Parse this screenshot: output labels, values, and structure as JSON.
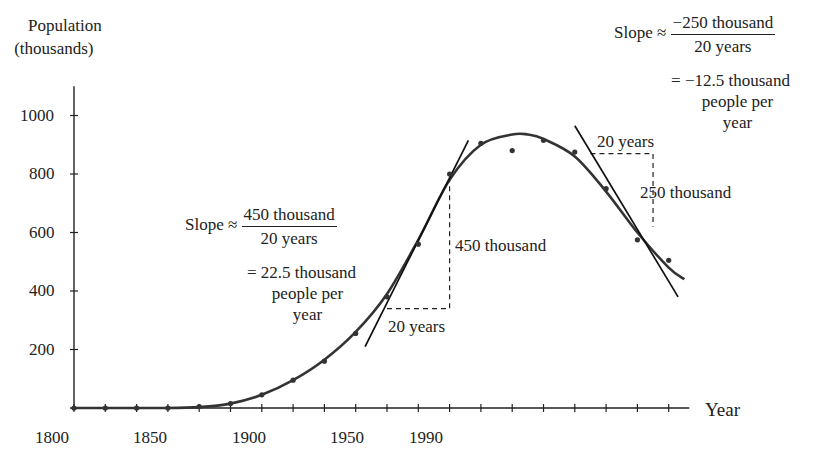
{
  "chart_data": {
    "type": "scatter",
    "title": "",
    "ylabel": "Population (thousands)",
    "ylabel_lines": [
      "Population",
      "(thousands)"
    ],
    "xlabel": "Year",
    "xlim": [
      1800,
      1995
    ],
    "ylim": [
      0,
      1100
    ],
    "x_tick_labels": [
      "1800",
      "1850",
      "1900",
      "1950",
      "1990"
    ],
    "x_tick_values": [
      1800,
      1850,
      1900,
      1950,
      1990
    ],
    "x_minor_ticks_every": 10,
    "y_tick_labels": [
      "200",
      "400",
      "600",
      "800",
      "1000"
    ],
    "y_tick_values": [
      200,
      400,
      600,
      800,
      1000
    ],
    "grid": false,
    "legend": null,
    "series": [
      {
        "name": "Population data points",
        "type": "scatter",
        "x": [
          1800,
          1810,
          1820,
          1830,
          1840,
          1850,
          1860,
          1870,
          1880,
          1890,
          1900,
          1910,
          1920,
          1930,
          1940,
          1950,
          1960,
          1970,
          1980,
          1990
        ],
        "values": [
          0,
          0,
          0,
          0,
          5,
          15,
          45,
          95,
          160,
          255,
          380,
          560,
          800,
          905,
          880,
          915,
          875,
          750,
          575,
          505
        ]
      },
      {
        "name": "Fitted curve",
        "type": "line",
        "x": [
          1800,
          1830,
          1840,
          1850,
          1860,
          1870,
          1880,
          1890,
          1900,
          1910,
          1920,
          1930,
          1940,
          1945,
          1950,
          1960,
          1970,
          1980,
          1990,
          1995
        ],
        "values": [
          0,
          0,
          3,
          15,
          45,
          95,
          165,
          260,
          390,
          575,
          780,
          900,
          935,
          935,
          920,
          860,
          740,
          600,
          480,
          440
        ]
      },
      {
        "name": "Tangent line near 1920",
        "type": "line",
        "x": [
          1893,
          1926
        ],
        "values": [
          210,
          915
        ]
      },
      {
        "name": "Tangent line near 1970",
        "type": "line",
        "x": [
          1960,
          1993
        ],
        "values": [
          965,
          380
        ]
      }
    ],
    "annotations": [
      {
        "id": "slope_left",
        "text": "Slope ≈ 450 thousand / 20 years = 22.5 thousand people per year",
        "slope_prefix": "Slope ≈",
        "numerator": "450 thousand",
        "denominator": "20 years",
        "result_lines": [
          "= 22.5 thousand",
          "people per",
          "year"
        ]
      },
      {
        "id": "slope_right",
        "text": "Slope ≈ −250 thousand / 20 years = −12.5 thousand people per year",
        "slope_prefix": "Slope ≈",
        "numerator": "−250 thousand",
        "denominator": "20 years",
        "result_lines": [
          "= −12.5 thousand",
          "people per",
          "year"
        ]
      },
      {
        "id": "run_left",
        "text": "20 years",
        "triangle": {
          "x0": 1900,
          "x1": 1920,
          "y0": 340,
          "y1": 790
        }
      },
      {
        "id": "rise_left",
        "text": "450 thousand"
      },
      {
        "id": "run_right",
        "text": "20 years",
        "triangle": {
          "x0": 1965,
          "x1": 1985,
          "y0": 870,
          "y1": 620
        }
      },
      {
        "id": "rise_right",
        "text": "250 thousand"
      }
    ]
  },
  "labels": {
    "ylabel_line1": "Population",
    "ylabel_line2": "(thousands)",
    "xlabel": "Year",
    "left": {
      "prefix": "Slope ≈",
      "num": "450 thousand",
      "den": "20 years",
      "r1": "= 22.5 thousand",
      "r2": "people per",
      "r3": "year",
      "run": "20 years",
      "rise": "450 thousand"
    },
    "right": {
      "prefix": "Slope ≈",
      "num": "−250 thousand",
      "den": "20 years",
      "r1": "= −12.5 thousand",
      "r2": "people per",
      "r3": "year",
      "run": "20 years",
      "rise": "250 thousand"
    }
  },
  "style": {
    "ink": "#222222",
    "curve": "#333333",
    "background": "#ffffff"
  }
}
